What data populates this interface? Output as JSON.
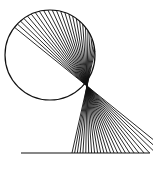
{
  "figure": {
    "width": 153,
    "height": 170,
    "background": "#ffffff",
    "stroke": "#111111",
    "circle": {
      "cx": 50,
      "cy": 55,
      "r": 45,
      "stroke_width": 1.2
    },
    "focus": {
      "x": 87,
      "y": 86
    },
    "base_line": {
      "y": 153,
      "x1": 21,
      "x2": 150,
      "stroke_width": 1.2
    },
    "rays": {
      "count": 26,
      "stroke_width": 0.9,
      "circle_angle_start_deg": 218,
      "circle_angle_end_deg": 355
    }
  }
}
